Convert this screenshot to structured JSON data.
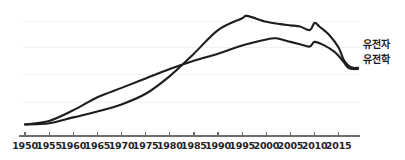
{
  "chart_data": {
    "type": "line",
    "title": "",
    "xlabel": "",
    "ylabel": "",
    "xlim": [
      1950,
      2019
    ],
    "ylim": [
      0,
      100
    ],
    "grid": true,
    "legend_position": "right-end-of-line",
    "xticks": [
      1950,
      1955,
      1960,
      1965,
      1970,
      1975,
      1980,
      1985,
      1990,
      1995,
      2000,
      2005,
      2010,
      2015
    ],
    "xtick_labels": [
      "1950",
      "1955",
      "1960",
      "1965",
      "1970",
      "1975",
      "1980",
      "1985",
      "1990",
      "1995",
      "2000",
      "2005",
      "2010",
      "2015"
    ],
    "yticks": [],
    "ytick_labels": [],
    "gridlines_y": [
      22,
      45,
      68,
      90
    ],
    "series": [
      {
        "name": "유전자",
        "color": "#1d1d1d",
        "x": [
          1950,
          1955,
          1960,
          1965,
          1970,
          1975,
          1980,
          1985,
          1990,
          1995,
          1996,
          2000,
          2003,
          2005,
          2007,
          2009,
          2010,
          2011,
          2013,
          2015,
          2016,
          2017,
          2018,
          2019
        ],
        "values": [
          3,
          4,
          9,
          14,
          20,
          29,
          44,
          63,
          83,
          93,
          95,
          90,
          88,
          87,
          86,
          83,
          89,
          86,
          79,
          68,
          58,
          53,
          51,
          51
        ]
      },
      {
        "name": "유전학",
        "color": "#1d1d1d",
        "x": [
          1950,
          1955,
          1960,
          1965,
          1970,
          1975,
          1980,
          1985,
          1990,
          1995,
          2000,
          2002,
          2005,
          2007,
          2009,
          2010,
          2012,
          2014,
          2015,
          2016,
          2017,
          2018,
          2019
        ],
        "values": [
          3,
          6,
          15,
          26,
          34,
          42,
          50,
          57,
          63,
          70,
          75,
          76,
          73,
          71,
          69,
          73,
          70,
          65,
          61,
          56,
          51,
          50,
          50
        ]
      }
    ],
    "annotations": []
  },
  "legend": {
    "items": [
      {
        "label": "유전자"
      },
      {
        "label": "유전학"
      }
    ]
  },
  "axis": {
    "x_labels": [
      "1950",
      "1955",
      "1960",
      "1965",
      "1970",
      "1975",
      "1980",
      "1985",
      "1990",
      "1995",
      "2000",
      "2005",
      "2010",
      "2015"
    ]
  },
  "colors": {
    "line": "#1d1d1d",
    "grid": "#f2f2f2",
    "axis": "#6e6e6e",
    "text": "#232323",
    "background": "#ffffff"
  }
}
